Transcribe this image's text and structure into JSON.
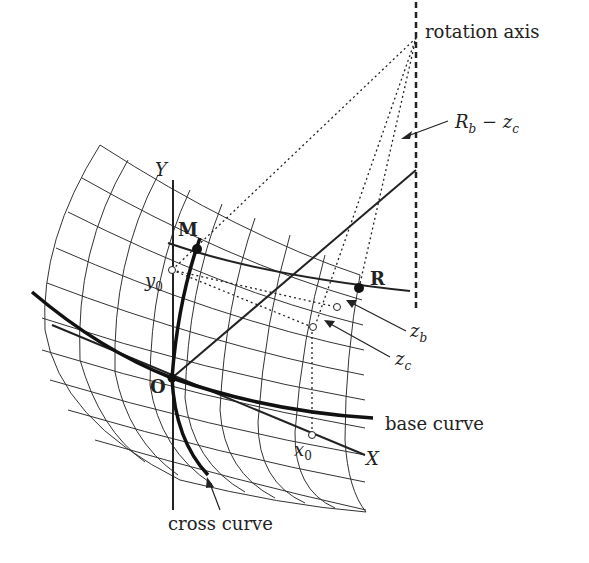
{
  "figure": {
    "labels": {
      "rotation_axis": "rotation axis",
      "rb_minus_zc_main": "R",
      "rb_sub": "b",
      "minus": " − z",
      "zc_sub": "c",
      "Y": "Y",
      "X": "X",
      "M": "M",
      "R": "R",
      "O": "O",
      "y0_main": "y",
      "y0_sub": "0",
      "x0_main": "x",
      "x0_sub": "0",
      "zb_main": "z",
      "zb_sub": "b",
      "zc_main": "z",
      "zc_sub2": "c",
      "base_curve": "base curve",
      "cross_curve": "cross curve"
    },
    "points": {
      "O": [
        172,
        378
      ],
      "M": [
        197,
        249
      ],
      "R": [
        359,
        288
      ],
      "axis_top_point": [
        416,
        40
      ],
      "axis_mid_point": [
        416,
        168
      ]
    },
    "colors": {
      "ink": "#222222",
      "grid": "#333333",
      "background": "#ffffff"
    }
  }
}
